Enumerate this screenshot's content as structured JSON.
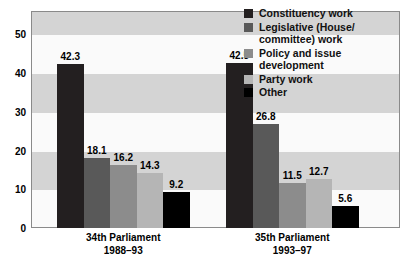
{
  "chart_data": {
    "type": "bar",
    "title": "",
    "subtitle": "",
    "xlabel": "",
    "ylabel": "",
    "ylim": [
      0,
      56
    ],
    "yticks": [
      0,
      10,
      20,
      30,
      40,
      50
    ],
    "grid": "alternating horizontal bands every 10 units",
    "legend_position": "top-right inside plot area",
    "categories": [
      "34th Parliament\n1988–93",
      "35th Parliament\n1993–97"
    ],
    "category_lines": [
      [
        "34th Parliament",
        "1988–93"
      ],
      [
        "35th Parliament",
        "1993–97"
      ]
    ],
    "series": [
      {
        "name": "Constituency work",
        "color": "#231f20",
        "values": [
          42.3,
          42.5
        ]
      },
      {
        "name": "Legislative (House/committee) work",
        "color": "#595959",
        "values": [
          18.1,
          26.8
        ]
      },
      {
        "name": "Policy and issue development",
        "color": "#8c8c8c",
        "values": [
          16.2,
          11.5
        ]
      },
      {
        "name": "Party work",
        "color": "#b5b5b5",
        "values": [
          14.3,
          12.7
        ]
      },
      {
        "name": "Other",
        "color": "#000000",
        "values": [
          9.2,
          5.6
        ]
      }
    ]
  },
  "legend": {
    "items": [
      {
        "label_lines": [
          "Constituency work"
        ],
        "swatch": "#231f20"
      },
      {
        "label_lines": [
          "Legislative (House/",
          "committee) work"
        ],
        "swatch": "#595959"
      },
      {
        "label_lines": [
          "Policy and issue",
          "development"
        ],
        "swatch": "#8c8c8c"
      },
      {
        "label_lines": [
          "Party work"
        ],
        "swatch": "#b5b5b5"
      },
      {
        "label_lines": [
          "Other"
        ],
        "swatch": "#000000"
      }
    ]
  },
  "axis": {
    "y_tick_labels": [
      "0",
      "10",
      "20",
      "30",
      "40",
      "50"
    ]
  },
  "colors": {
    "band_grey": "#d4d4d4",
    "band_white": "#fafafa",
    "frame": "#8a8a8a",
    "text": "#000000"
  }
}
